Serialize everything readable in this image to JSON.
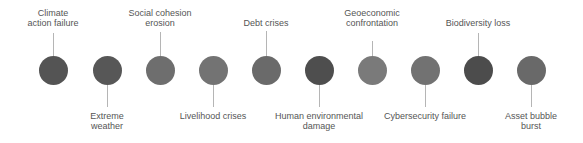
{
  "diagram": {
    "type": "risk-timeline",
    "connector_color": "#b5b5b5",
    "text_color": "#555555",
    "nodes": [
      {
        "lines": [
          "Climate",
          "action failure"
        ],
        "position": "top",
        "x": 53,
        "color": "#545454",
        "connector_len": 23
      },
      {
        "lines": [
          "Extreme",
          "weather"
        ],
        "position": "bottom",
        "x": 107,
        "color": "#575757",
        "connector_len": 22
      },
      {
        "lines": [
          "Social cohesion",
          "erosion"
        ],
        "position": "top",
        "x": 160,
        "color": "#6e6e6e",
        "connector_len": 24
      },
      {
        "lines": [
          "Livelihood crises"
        ],
        "position": "bottom",
        "x": 213,
        "color": "#737373",
        "connector_len": 22
      },
      {
        "lines": [
          "Debt crises"
        ],
        "position": "top",
        "x": 266,
        "color": "#6a6a6a",
        "connector_len": 25
      },
      {
        "lines": [
          "Human environmental",
          "damage"
        ],
        "position": "bottom",
        "x": 319,
        "color": "#4e4e4e",
        "connector_len": 22
      },
      {
        "lines": [
          "Geoeconomic",
          "confrontation"
        ],
        "position": "top",
        "x": 372,
        "color": "#7a7a7a",
        "connector_len": 15
      },
      {
        "lines": [
          "Cybersecurity failure"
        ],
        "position": "bottom",
        "x": 425,
        "color": "#727272",
        "connector_len": 22
      },
      {
        "lines": [
          "Biodiversity loss"
        ],
        "position": "top",
        "x": 478,
        "color": "#4c4c4c",
        "connector_len": 23
      },
      {
        "lines": [
          "Asset bubble",
          "burst"
        ],
        "position": "bottom",
        "x": 531,
        "color": "#696969",
        "connector_len": 22
      }
    ]
  }
}
